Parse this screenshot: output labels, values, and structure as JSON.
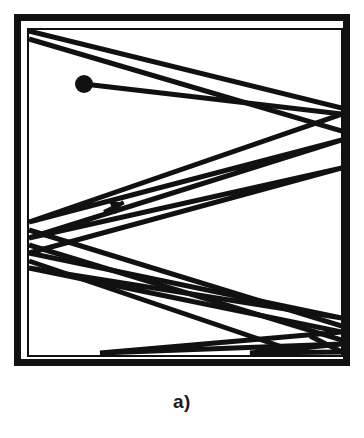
{
  "figure": {
    "caption": "a)",
    "kind": "billiard-trajectory-diagram",
    "colors": {
      "ink": "#111111",
      "background": "#ffffff"
    },
    "frame": {
      "outer": {
        "x": 14,
        "y": 14,
        "width": 336,
        "height": 352,
        "stroke_width": 7
      },
      "inner": {
        "x": 28,
        "y": 29,
        "width": 314,
        "height": 327,
        "stroke_width": 2
      }
    },
    "particle": {
      "label": "start-point",
      "cx": 84,
      "cy": 84,
      "r": 9
    },
    "direction_arrow": {
      "label": "direction-of-motion",
      "x": 104,
      "y": 212,
      "angle_deg": -26,
      "length": 22
    },
    "trajectory": {
      "stroke_width": 5,
      "path_points": [
        [
          84,
          84
        ],
        [
          342,
          114
        ],
        [
          29,
          222
        ],
        [
          342,
          140
        ],
        [
          29,
          238
        ],
        [
          342,
          168
        ],
        [
          29,
          253
        ],
        [
          342,
          318
        ],
        [
          29,
          268
        ],
        [
          342,
          332
        ],
        [
          100,
          353
        ],
        [
          342,
          344
        ],
        [
          250,
          353
        ],
        [
          342,
          352
        ]
      ],
      "extra_segments": [
        {
          "name": "top-edge-ray",
          "from": [
            29,
            31
          ],
          "to": [
            342,
            108
          ]
        },
        {
          "name": "second-top-ray",
          "from": [
            29,
            39
          ],
          "to": [
            342,
            131
          ]
        },
        {
          "name": "lower-left-return",
          "from": [
            29,
            230
          ],
          "to": [
            342,
            326
          ]
        },
        {
          "name": "lower-left-return-2",
          "from": [
            29,
            245
          ],
          "to": [
            342,
            340
          ]
        },
        {
          "name": "lower-left-return-3",
          "from": [
            29,
            261
          ],
          "to": [
            300,
            353
          ]
        },
        {
          "name": "bottom-corner-ray",
          "from": [
            310,
            336
          ],
          "to": [
            342,
            352
          ]
        }
      ]
    }
  }
}
